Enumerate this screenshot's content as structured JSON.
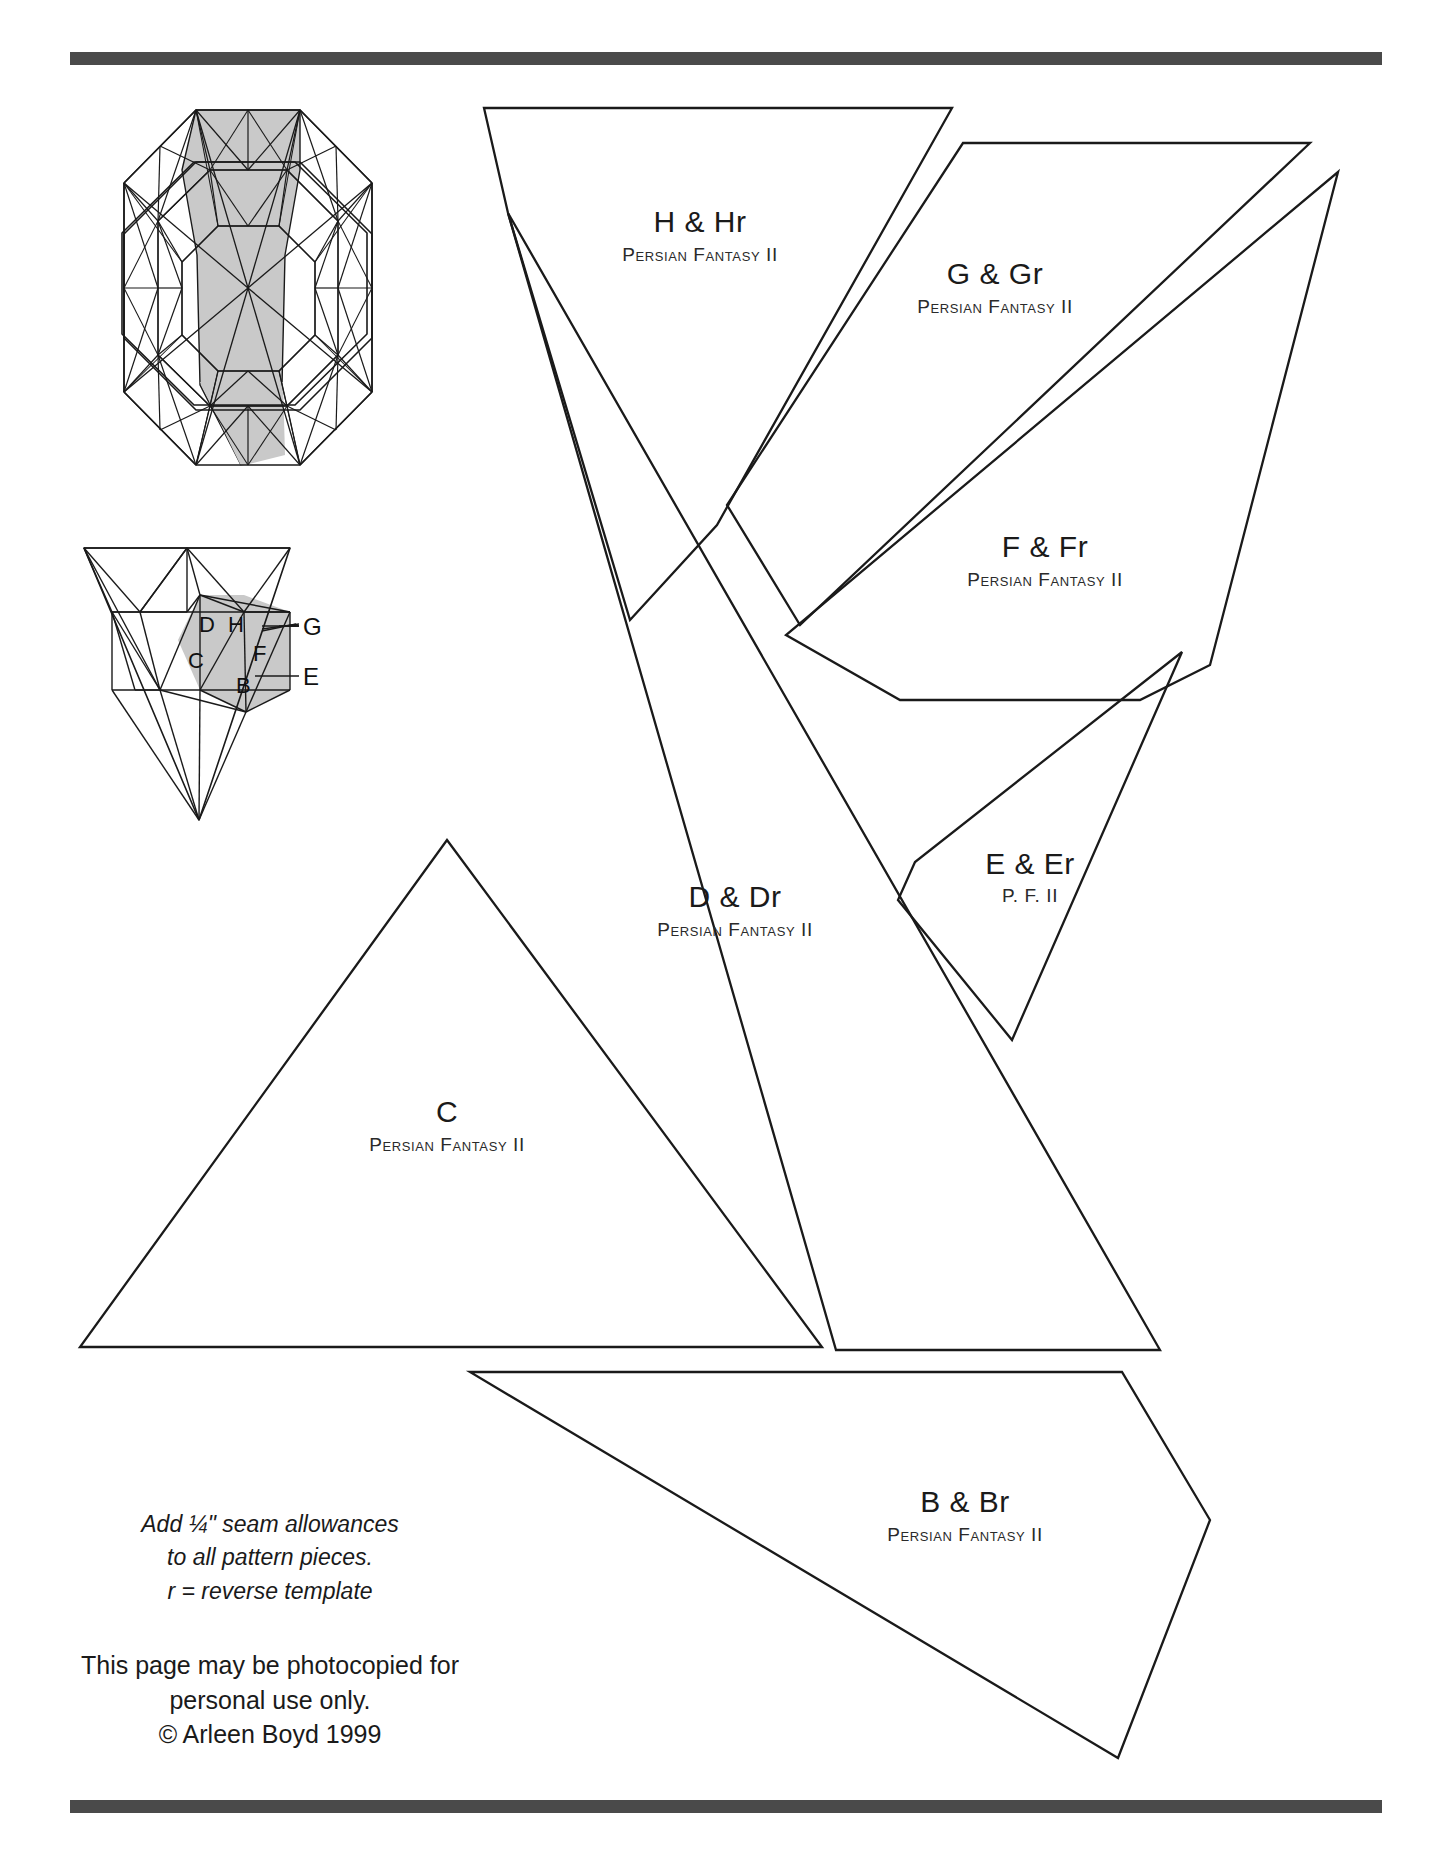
{
  "page": {
    "background_color": "#ffffff",
    "rule_color": "#4a4a4a",
    "line_color": "#1a1a1a",
    "shade_color": "#c9c9c9"
  },
  "pattern_pieces": [
    {
      "id": "H",
      "title": "H & Hr",
      "subtitle": "Persian Fantasy II"
    },
    {
      "id": "G",
      "title": "G & Gr",
      "subtitle": "Persian Fantasy II"
    },
    {
      "id": "F",
      "title": "F & Fr",
      "subtitle": "Persian Fantasy II"
    },
    {
      "id": "E",
      "title": "E & Er",
      "subtitle": "P. F. II"
    },
    {
      "id": "D",
      "title": "D & Dr",
      "subtitle": "Persian Fantasy II"
    },
    {
      "id": "C",
      "title": "C",
      "subtitle": "Persian Fantasy II"
    },
    {
      "id": "B",
      "title": "B & Br",
      "subtitle": "Persian Fantasy II"
    }
  ],
  "block_diagram": {
    "name": "octagon-kaleidoscope-block",
    "shaded_wedge": "top-center-wedge"
  },
  "wedge_diagram": {
    "name": "wedge-piece-key",
    "inner_labels": [
      "D",
      "H",
      "C",
      "F",
      "B"
    ],
    "leader_labels": [
      "G",
      "E"
    ]
  },
  "notes": {
    "seam_line_1": "Add ¼\" seam allowances",
    "seam_line_2": "to all pattern pieces.",
    "seam_line_3": "r = reverse template",
    "copyright_line_1": "This page may be photocopied for",
    "copyright_line_2": "personal use only.",
    "copyright_line_3": "© Arleen Boyd 1999"
  }
}
